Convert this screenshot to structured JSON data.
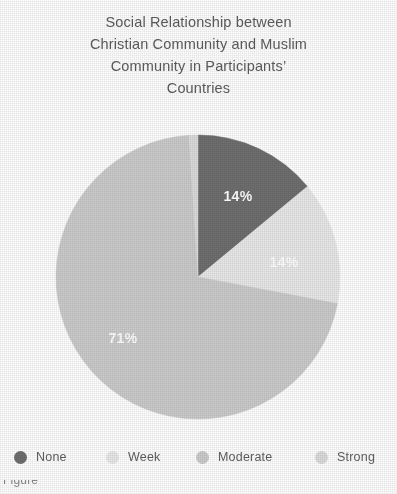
{
  "title": {
    "lines": [
      "Social Relationship between",
      "Christian Community and Muslim",
      "Community in Participants’",
      "Countries"
    ]
  },
  "footnote": {
    "text": "Figure",
    "marker": "1"
  },
  "colors": {
    "none": "#6f6f6f",
    "week": "#e9e9e9",
    "moderate": "#cccccc",
    "strong": "#dcdcdc",
    "label_text": "#ffffff",
    "title_text": "#5d5d5d",
    "legend_text": "#5f5f5f",
    "background": "#ffffff"
  },
  "legend": {
    "items": [
      {
        "label": "None",
        "color": "#6f6f6f",
        "x": 14
      },
      {
        "label": "Week",
        "color": "#e9e9e9",
        "x": 106
      },
      {
        "label": "Moderate",
        "color": "#cccccc",
        "x": 196
      },
      {
        "label": "Strong",
        "color": "#dcdcdc",
        "x": 315
      }
    ]
  },
  "chart_data": {
    "type": "pie",
    "title": "Social Relationship between Christian Community and Muslim Community in Participants’ Countries",
    "categories": [
      "None",
      "Week",
      "Moderate",
      "Strong"
    ],
    "values": [
      14,
      14,
      71,
      1
    ],
    "value_unit": "%",
    "data_labels": [
      "14%",
      "14%",
      "71%",
      ""
    ],
    "colors": [
      "#6f6f6f",
      "#e9e9e9",
      "#cccccc",
      "#dcdcdc"
    ],
    "legend_position": "bottom",
    "start_angle_deg": 0,
    "direction": "clockwise",
    "grid": false,
    "slices": [
      {
        "name": "None",
        "value": 14,
        "label": "14%",
        "color": "#6f6f6f",
        "start_deg": 0.0,
        "end_deg": 50.4,
        "label_x": 238,
        "label_y": 197,
        "show_label": true
      },
      {
        "name": "Week",
        "value": 14,
        "label": "14%",
        "color": "#e9e9e9",
        "start_deg": 50.4,
        "end_deg": 100.8,
        "label_x": 284,
        "label_y": 263,
        "show_label": true
      },
      {
        "name": "Moderate",
        "value": 71,
        "label": "71%",
        "color": "#cccccc",
        "start_deg": 100.8,
        "end_deg": 356.4,
        "label_x": 123,
        "label_y": 339,
        "show_label": true
      },
      {
        "name": "Strong",
        "value": 1,
        "label": "",
        "color": "#dcdcdc",
        "start_deg": 356.4,
        "end_deg": 360.0,
        "label_x": 198,
        "label_y": 150,
        "show_label": false
      }
    ],
    "geometry": {
      "cx": 198,
      "cy": 277,
      "r": 142
    }
  }
}
